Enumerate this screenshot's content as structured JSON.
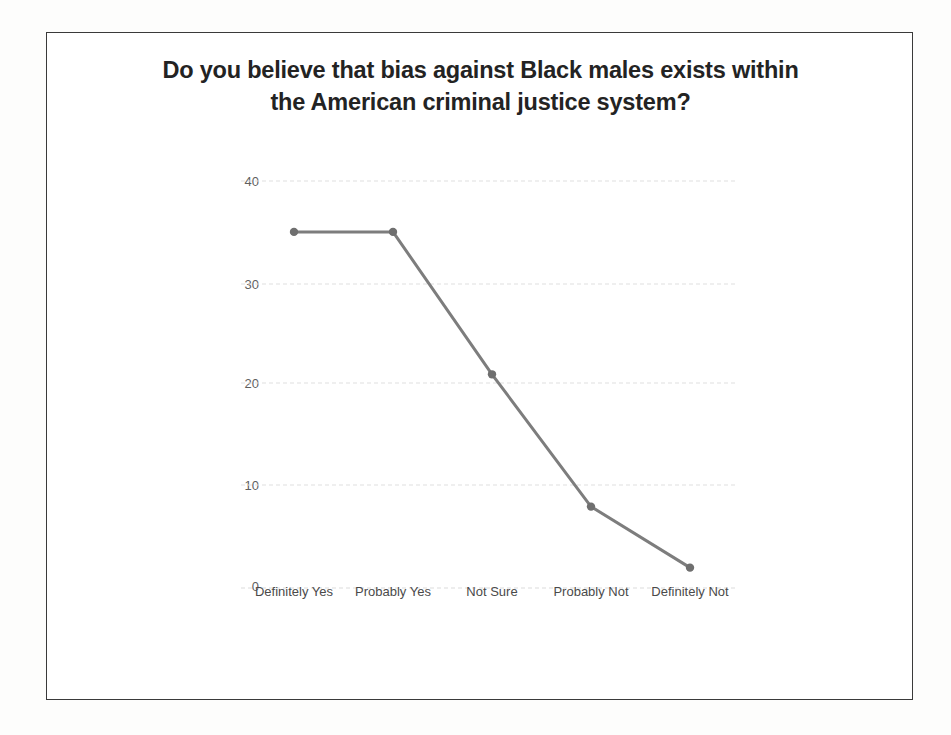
{
  "page": {
    "background_color": "#fdfdfc",
    "frame_border_color": "#3a3a3a"
  },
  "chart_title_line1": "Do you believe that bias against Black males exists within",
  "chart_title_line2": "the American criminal justice system?",
  "chart_data": {
    "type": "line",
    "title": "Do you believe that bias against Black males exists within the American criminal justice system?",
    "xlabel": "",
    "ylabel": "",
    "categories": [
      "Definitely Yes",
      "Probably Yes",
      "Not Sure",
      "Probably Not",
      "Definitely Not"
    ],
    "values": [
      35,
      35,
      21,
      8,
      2
    ],
    "series": [
      {
        "name": "Responses",
        "values": [
          35,
          35,
          21,
          8,
          2
        ]
      }
    ],
    "ylim": [
      0,
      40
    ],
    "yticks": [
      0,
      10,
      20,
      30,
      40
    ],
    "ytick_labels": [
      "0",
      "10",
      "20",
      "30",
      "40"
    ],
    "grid": true,
    "grid_style": "dotted",
    "grid_color": "#e2e2e2",
    "legend": false,
    "legend_position": "none",
    "line_color": "#7d7d7d",
    "marker_color": "#6f6f6f",
    "marker_shape": "circle"
  }
}
